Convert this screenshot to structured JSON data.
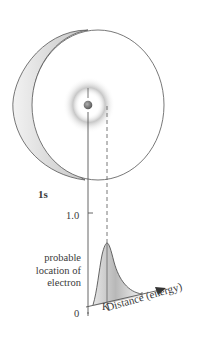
{
  "diagram": {
    "orbital_label": "1s",
    "y_axis": {
      "tick_label": "1.0",
      "label_lines": [
        "probable",
        "location of",
        "electron"
      ],
      "origin_label": "0"
    },
    "x_axis": {
      "label": "Distance (energy)",
      "marker_label": "K"
    }
  },
  "colors": {
    "line": "#555555",
    "shading": "#bdbdbd",
    "disc_rim": "#dedede",
    "nucleus": "#7a7a7a"
  }
}
